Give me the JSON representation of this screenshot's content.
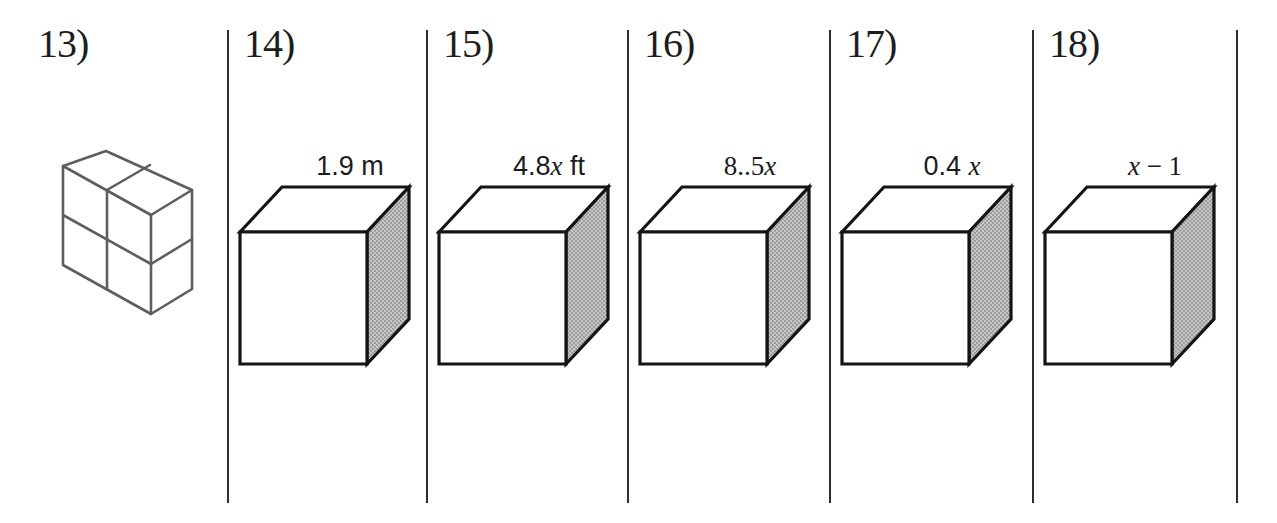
{
  "page": {
    "type": "math worksheet strip",
    "background": "#ffffff"
  },
  "colors": {
    "cube_outline": "#141414",
    "unit_figure_outline": "#5e5e5e",
    "shaded_face_base": "#c6c6c6",
    "shaded_face_dot": "#8a8a8a",
    "divider": "#2e2e2e",
    "text": "#1b1b1b"
  },
  "panels": [
    {
      "number_label": "13)",
      "figure": "prism-of-unit-cubes",
      "figure_description": "isometric 2 x 2 x 1 block of unit cubes, unshaded, gray outline",
      "dimension_label": "",
      "label_prefix": "",
      "label_var": "",
      "label_suffix": ""
    },
    {
      "number_label": "14)",
      "figure": "cube-shaded-right-face",
      "dimension_label": "1.9 m",
      "label_prefix": "1.9 m",
      "label_var": "",
      "label_suffix": ""
    },
    {
      "number_label": "15)",
      "figure": "cube-shaded-right-face",
      "dimension_label": "4.8x ft",
      "label_prefix": "4.8",
      "label_var": "x",
      "label_suffix": " ft"
    },
    {
      "number_label": "16)",
      "figure": "cube-shaded-right-face",
      "dimension_label": "8..5x",
      "label_prefix": "8..5",
      "label_var": "x",
      "label_suffix": ""
    },
    {
      "number_label": "17)",
      "figure": "cube-shaded-right-face",
      "dimension_label": "0.4 x",
      "label_prefix": "0.4 ",
      "label_var": "x",
      "label_suffix": ""
    },
    {
      "number_label": "18)",
      "figure": "cube-shaded-right-face",
      "dimension_label": "x − 1",
      "label_prefix": "",
      "label_var": "x",
      "label_suffix": " − 1"
    }
  ]
}
